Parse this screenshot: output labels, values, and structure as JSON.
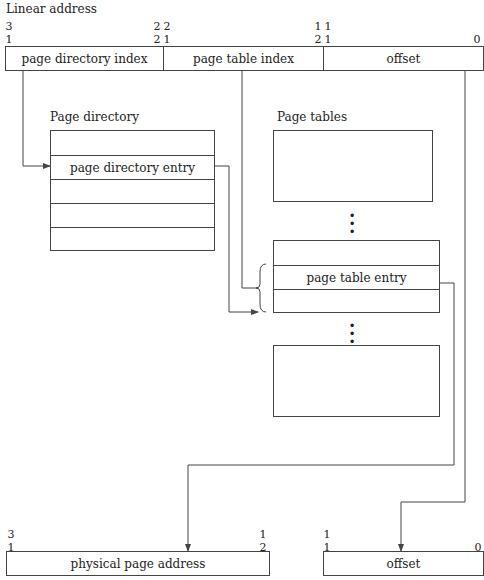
{
  "title": "Linear address",
  "linear_address": {
    "fields": [
      {
        "label": "page directory index",
        "bits_hi": [
          "3",
          "1"
        ],
        "bits_lo": [
          "2",
          "2"
        ]
      },
      {
        "label": "page table index",
        "bits_hi": [
          "2",
          "1"
        ],
        "bits_lo": [
          "1",
          "2"
        ]
      },
      {
        "label": "offset",
        "bits_hi": [
          "1",
          "1"
        ],
        "bits_lo": [
          "0"
        ]
      }
    ]
  },
  "page_directory": {
    "label": "Page directory",
    "rows": [
      "",
      "page directory entry",
      "",
      "",
      ""
    ]
  },
  "page_tables": {
    "label": "Page tables",
    "entry_table_rows": [
      "",
      "page table entry",
      ""
    ],
    "ellipsis": "⋮"
  },
  "physical_address": {
    "fields": [
      {
        "label": "physical page address",
        "bits_hi": [
          "3",
          "1"
        ],
        "bits_lo": [
          "1",
          "2"
        ]
      },
      {
        "label": "offset",
        "bits_hi": [
          "1",
          "1"
        ],
        "bits_lo": [
          "0"
        ]
      }
    ]
  },
  "colors": {
    "line": "#444444",
    "background": "#ffffff"
  }
}
